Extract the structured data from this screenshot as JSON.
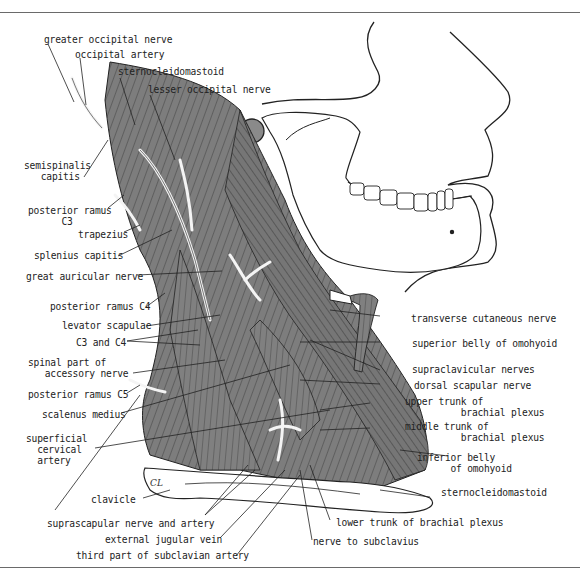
{
  "figure": {
    "colors": {
      "muscle": "#7a7a7a",
      "muscle_dark": "#5e5e5e",
      "muscle_stripe": "#3a3a3a",
      "nerve": "#eeeeee",
      "bone": "#ffffff",
      "outline": "#222222",
      "frame": "#6a6a6a"
    },
    "artist_mark": "CL"
  },
  "labels_left": [
    {
      "id": "greater-occipital-nerve",
      "text": "greater occipital nerve"
    },
    {
      "id": "occipital-artery",
      "text": "occipital artery"
    },
    {
      "id": "sternocleidomastoid-top",
      "text": "sternocleidomastoid"
    },
    {
      "id": "lesser-occipital-nerve",
      "text": "lesser occipital nerve"
    },
    {
      "id": "semispinalis-capitis",
      "text": "semispinalis\n   capitis"
    },
    {
      "id": "posterior-ramus-c3",
      "text": "posterior ramus\n      C3"
    },
    {
      "id": "trapezius",
      "text": "trapezius"
    },
    {
      "id": "splenius-capitis",
      "text": "splenius capitis"
    },
    {
      "id": "great-auricular-nerve",
      "text": "great auricular nerve"
    },
    {
      "id": "posterior-ramus-c4",
      "text": "posterior ramus C4"
    },
    {
      "id": "levator-scapulae",
      "text": "levator scapulae"
    },
    {
      "id": "c3-and-c4",
      "text": "C3 and C4"
    },
    {
      "id": "spinal-part-accessory-nerve",
      "text": "spinal part of\n   accessory nerve"
    },
    {
      "id": "posterior-ramus-c5",
      "text": "posterior ramus C5"
    },
    {
      "id": "scalenus-medius",
      "text": "scalenus medius"
    },
    {
      "id": "superficial-cervical-artery",
      "text": "superficial\n  cervical\n  artery"
    }
  ],
  "labels_bottom": [
    {
      "id": "clavicle",
      "text": "clavicle"
    },
    {
      "id": "suprascapular-nerve-artery",
      "text": "suprascapular nerve and artery"
    },
    {
      "id": "external-jugular-vein",
      "text": "external jugular vein"
    },
    {
      "id": "third-part-subclavian-artery",
      "text": "third part of subclavian artery"
    },
    {
      "id": "lower-trunk-brachial-plexus",
      "text": "lower trunk of brachial plexus"
    },
    {
      "id": "nerve-to-subclavius",
      "text": "nerve to subclavius"
    }
  ],
  "labels_right": [
    {
      "id": "transverse-cutaneous-nerve",
      "text": "transverse cutaneous nerve"
    },
    {
      "id": "superior-belly-omohyoid",
      "text": "superior belly of omohyoid"
    },
    {
      "id": "supraclavicular-nerves",
      "text": "supraclavicular nerves"
    },
    {
      "id": "dorsal-scapular-nerve",
      "text": "dorsal scapular nerve"
    },
    {
      "id": "upper-trunk-brachial-plexus",
      "text": "upper trunk of\n          brachial plexus"
    },
    {
      "id": "middle-trunk-brachial-plexus",
      "text": "middle trunk of\n          brachial plexus"
    },
    {
      "id": "inferior-belly-omohyoid",
      "text": "inferior belly\n      of omohyoid"
    },
    {
      "id": "sternocleidomastoid-bottom",
      "text": "sternocleidomastoid"
    }
  ]
}
